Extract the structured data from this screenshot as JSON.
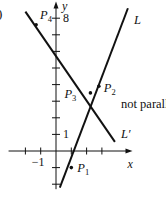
{
  "figure": {
    "partial_label": ")",
    "axes": {
      "x_label": "x",
      "y_label": "y",
      "x_tick_labels": [
        {
          "value": -1,
          "text": "−1"
        }
      ],
      "y_tick_labels": [
        {
          "value": 1,
          "text": "1"
        },
        {
          "value": 8,
          "text": "8"
        }
      ],
      "x_ticks": [
        -2,
        -1,
        1,
        2,
        3
      ],
      "y_ticks": [
        -2,
        -1,
        1,
        2,
        3,
        4,
        5,
        6,
        7,
        8
      ],
      "x_range": [
        -3.1,
        5
      ],
      "y_range": [
        -2.3,
        9
      ]
    },
    "lines": [
      {
        "name": "L",
        "label": "L",
        "from": [
          0.25,
          -2.2
        ],
        "to": [
          4.7,
          8.6
        ]
      },
      {
        "name": "L-prime",
        "label": "L′",
        "from": [
          -2.0,
          8.4
        ],
        "to": [
          3.85,
          0.55
        ]
      }
    ],
    "points": [
      {
        "name": "P1",
        "main": "P",
        "sub": "1",
        "x": 1,
        "y": -1
      },
      {
        "name": "P2",
        "main": "P",
        "sub": "2",
        "x": 2.8,
        "y": 3.9
      },
      {
        "name": "P3",
        "main": "P",
        "sub": "3",
        "x": 2.25,
        "y": 3.5
      },
      {
        "name": "P4",
        "main": "P",
        "sub": "4",
        "x": -1.3,
        "y": 7.6
      }
    ],
    "annotation": "not parallel",
    "colors": {
      "ink": "#111111",
      "background": "#ffffff"
    }
  }
}
